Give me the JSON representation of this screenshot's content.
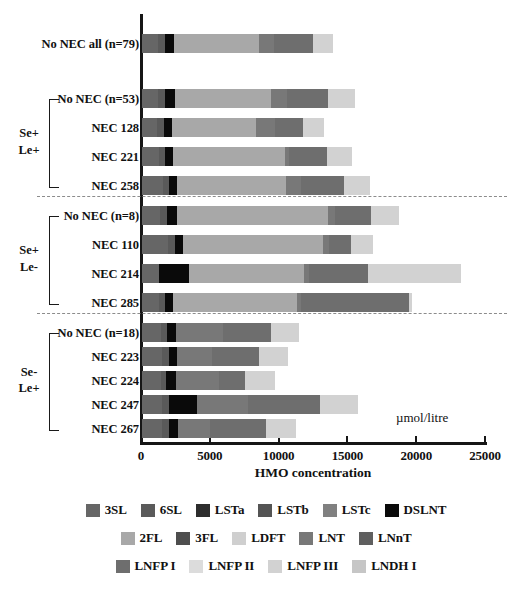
{
  "chart_data": {
    "type": "bar",
    "orientation": "horizontal",
    "stacked": true,
    "title": "",
    "xlabel": "HMO concentration",
    "ylabel": "",
    "units": "µmol/litre",
    "xlim": [
      0,
      25000
    ],
    "xticks": [
      0,
      5000,
      10000,
      15000,
      20000,
      25000
    ],
    "xtick_labels": [
      "0",
      "5000",
      "10000",
      "15000",
      "20000",
      "25000"
    ],
    "grid": false,
    "legend_position": "bottom",
    "series": [
      {
        "name": "3SL",
        "color": "#666666"
      },
      {
        "name": "6SL",
        "color": "#5a5a5a"
      },
      {
        "name": "LSTa",
        "color": "#2d2d2d"
      },
      {
        "name": "LSTb",
        "color": "#545454"
      },
      {
        "name": "LSTc",
        "color": "#808080"
      },
      {
        "name": "DSLNT",
        "color": "#0a0a0a"
      },
      {
        "name": "2FL",
        "color": "#a8a8a8"
      },
      {
        "name": "3FL",
        "color": "#4e4e4e"
      },
      {
        "name": "LDFT",
        "color": "#cfcfcf"
      },
      {
        "name": "LNT",
        "color": "#787878"
      },
      {
        "name": "LNnT",
        "color": "#5f5f5f"
      },
      {
        "name": "LNFP I",
        "color": "#6e6e6e"
      },
      {
        "name": "LNFP II",
        "color": "#dcdcdc"
      },
      {
        "name": "LNFP III",
        "color": "#d2d2d2"
      },
      {
        "name": "LNDH I",
        "color": "#c6c6c6"
      }
    ],
    "categories": [
      "No NEC all (n=79)",
      "No NEC (n=53)",
      "NEC 128",
      "NEC 221",
      "NEC 258",
      "No NEC (n=8)",
      "NEC 110",
      "NEC 214",
      "NEC 285",
      "No NEC (n=18)",
      "NEC 223",
      "NEC 224",
      "NEC 247",
      "NEC 267"
    ],
    "groups": [
      {
        "label": "",
        "categories": [
          "No NEC all (n=79)"
        ]
      },
      {
        "label": "Se+\nLe+",
        "categories": [
          "No NEC (n=53)",
          "NEC 128",
          "NEC 221",
          "NEC 258"
        ]
      },
      {
        "label": "Se+\nLe-",
        "categories": [
          "No NEC (n=8)",
          "NEC 110",
          "NEC 214",
          "NEC 285"
        ]
      },
      {
        "label": "Se-\nLe+",
        "categories": [
          "No NEC (n=18)",
          "NEC 223",
          "NEC 224",
          "NEC 247",
          "NEC 267"
        ]
      }
    ],
    "rows": [
      {
        "category": "No NEC all (n=79)",
        "total": 13900,
        "values": {
          "3SL": 1150,
          "6SL": 520,
          "LSTa": 0,
          "LSTb": 0,
          "LSTc": 0,
          "DSLNT": 680,
          "2FL": 6150,
          "3FL": 0,
          "LDFT": 0,
          "LNT": 1100,
          "LNnT": 0,
          "LNFP I": 2800,
          "LNFP II": 0,
          "LNFP III": 1500,
          "LNDH I": 0
        }
      },
      {
        "category": "No NEC (n=53)",
        "total": 15500,
        "values": {
          "3SL": 1150,
          "6SL": 520,
          "LSTa": 0,
          "LSTb": 0,
          "LSTc": 0,
          "DSLNT": 700,
          "2FL": 7000,
          "3FL": 0,
          "LDFT": 0,
          "LNT": 1150,
          "LNnT": 0,
          "LNFP I": 3000,
          "LNFP II": 0,
          "LNFP III": 1980,
          "LNDH I": 0
        }
      },
      {
        "category": "NEC 128",
        "total": 13200,
        "values": {
          "3SL": 1100,
          "6SL": 500,
          "LSTa": 0,
          "LSTb": 0,
          "LSTc": 0,
          "DSLNT": 600,
          "2FL": 6100,
          "3FL": 0,
          "LDFT": 0,
          "LNT": 1350,
          "LNnT": 0,
          "LNFP I": 2050,
          "LNFP II": 0,
          "LNFP III": 1500,
          "LNDH I": 0
        }
      },
      {
        "category": "NEC 221",
        "total": 15300,
        "values": {
          "3SL": 1250,
          "6SL": 450,
          "LSTa": 0,
          "LSTb": 0,
          "LSTc": 0,
          "DSLNT": 560,
          "2FL": 8100,
          "3FL": 0,
          "LDFT": 0,
          "LNT": 300,
          "LNnT": 0,
          "LNFP I": 2800,
          "LNFP II": 0,
          "LNFP III": 1840,
          "LNDH I": 0
        }
      },
      {
        "category": "NEC 258",
        "total": 16600,
        "values": {
          "3SL": 1500,
          "6SL": 480,
          "LSTa": 0,
          "LSTb": 0,
          "LSTc": 0,
          "DSLNT": 600,
          "2FL": 7900,
          "3FL": 0,
          "LDFT": 0,
          "LNT": 1100,
          "LNnT": 0,
          "LNFP I": 3100,
          "LNFP II": 0,
          "LNFP III": 1920,
          "LNDH I": 0
        }
      },
      {
        "category": "No NEC (n=8)",
        "total": 18700,
        "values": {
          "3SL": 1300,
          "6SL": 530,
          "LSTa": 0,
          "LSTb": 0,
          "LSTc": 0,
          "DSLNT": 700,
          "2FL": 11000,
          "3FL": 0,
          "LDFT": 0,
          "LNT": 500,
          "LNnT": 0,
          "LNFP I": 2600,
          "LNFP II": 0,
          "LNFP III": 2070,
          "LNDH I": 0
        }
      },
      {
        "category": "NEC 110",
        "total": 16800,
        "values": {
          "3SL": 1900,
          "6SL": 520,
          "LSTa": 0,
          "LSTb": 0,
          "LSTc": 0,
          "DSLNT": 570,
          "2FL": 10200,
          "3FL": 0,
          "LDFT": 0,
          "LNT": 400,
          "LNnT": 0,
          "LNFP I": 1600,
          "LNFP II": 0,
          "LNFP III": 1610,
          "LNDH I": 0
        }
      },
      {
        "category": "NEC 214",
        "total": 23200,
        "values": {
          "3SL": 1250,
          "6SL": 0,
          "LSTa": 0,
          "LSTb": 0,
          "LSTc": 0,
          "DSLNT": 2200,
          "2FL": 8300,
          "3FL": 0,
          "LDFT": 0,
          "LNT": 400,
          "LNnT": 0,
          "LNFP I": 4300,
          "LNFP II": 0,
          "LNFP III": 6750,
          "LNDH I": 0
        }
      },
      {
        "category": "NEC 285",
        "total": 19600,
        "values": {
          "3SL": 1200,
          "6SL": 480,
          "LSTa": 0,
          "LSTb": 0,
          "LSTc": 0,
          "DSLNT": 600,
          "2FL": 9000,
          "3FL": 0,
          "LDFT": 0,
          "LNT": 250,
          "LNnT": 0,
          "LNFP I": 7900,
          "LNFP II": 0,
          "LNFP III": 170,
          "LNDH I": 0
        }
      },
      {
        "category": "No NEC (n=18)",
        "total": 11400,
        "values": {
          "3SL": 1400,
          "6SL": 450,
          "LSTa": 0,
          "LSTb": 0,
          "LSTc": 0,
          "DSLNT": 650,
          "2FL": 0,
          "3FL": 0,
          "LDFT": 0,
          "LNT": 3400,
          "LNnT": 0,
          "LNFP I": 3500,
          "LNFP II": 0,
          "LNFP III": 2000,
          "LNDH I": 0
        }
      },
      {
        "category": "NEC 223",
        "total": 10600,
        "values": {
          "3SL": 1450,
          "6SL": 480,
          "LSTa": 0,
          "LSTb": 0,
          "LSTc": 0,
          "DSLNT": 640,
          "2FL": 0,
          "3FL": 0,
          "LDFT": 0,
          "LNT": 2500,
          "LNnT": 0,
          "LNFP I": 3400,
          "LNFP II": 0,
          "LNFP III": 2130,
          "LNDH I": 0
        }
      },
      {
        "category": "NEC 224",
        "total": 9700,
        "values": {
          "3SL": 1350,
          "6SL": 420,
          "LSTa": 0,
          "LSTb": 0,
          "LSTc": 0,
          "DSLNT": 700,
          "2FL": 0,
          "3FL": 0,
          "LDFT": 0,
          "LNT": 3100,
          "LNnT": 0,
          "LNFP I": 1900,
          "LNFP II": 0,
          "LNFP III": 2230,
          "LNDH I": 0
        }
      },
      {
        "category": "NEC 247",
        "total": 15700,
        "values": {
          "3SL": 1450,
          "6SL": 480,
          "LSTa": 0,
          "LSTb": 0,
          "LSTc": 0,
          "DSLNT": 2100,
          "2FL": 0,
          "3FL": 0,
          "LDFT": 0,
          "LNT": 3700,
          "LNnT": 0,
          "LNFP I": 5200,
          "LNFP II": 0,
          "LNFP III": 2770,
          "LNDH I": 0
        }
      },
      {
        "category": "NEC 267",
        "total": 11200,
        "values": {
          "3SL": 1450,
          "6SL": 480,
          "LSTa": 0,
          "LSTb": 0,
          "LSTc": 0,
          "DSLNT": 700,
          "2FL": 0,
          "3FL": 0,
          "LDFT": 0,
          "LNT": 2300,
          "LNnT": 0,
          "LNFP I": 4100,
          "LNFP II": 0,
          "LNFP III": 2170,
          "LNDH I": 0
        }
      }
    ]
  },
  "axis": {
    "x_title": "HMO concentration",
    "unit_label": "µmol/litre",
    "ticks": [
      "0",
      "5000",
      "10000",
      "15000",
      "20000",
      "25000"
    ]
  },
  "groups": {
    "g1": "Se+\nLe+",
    "g1_line1": "Se+",
    "g1_line2": "Le+",
    "g2_line1": "Se+",
    "g2_line2": "Le-",
    "g3_line1": "Se-",
    "g3_line2": "Le+"
  },
  "legend": {
    "rows": [
      [
        {
          "label": "3SL",
          "color": "#666666"
        },
        {
          "label": "6SL",
          "color": "#5a5a5a"
        },
        {
          "label": "LSTa",
          "color": "#2d2d2d"
        },
        {
          "label": "LSTb",
          "color": "#545454"
        },
        {
          "label": "LSTc",
          "color": "#808080"
        },
        {
          "label": "DSLNT",
          "color": "#0a0a0a"
        }
      ],
      [
        {
          "label": "2FL",
          "color": "#a8a8a8"
        },
        {
          "label": "3FL",
          "color": "#4e4e4e"
        },
        {
          "label": "LDFT",
          "color": "#cfcfcf"
        },
        {
          "label": "LNT",
          "color": "#787878"
        },
        {
          "label": "LNnT",
          "color": "#5f5f5f"
        }
      ],
      [
        {
          "label": "LNFP I",
          "color": "#6e6e6e"
        },
        {
          "label": "LNFP II",
          "color": "#dcdcdc"
        },
        {
          "label": "LNFP III",
          "color": "#d2d2d2"
        },
        {
          "label": "LNDH I",
          "color": "#c6c6c6"
        }
      ]
    ]
  }
}
